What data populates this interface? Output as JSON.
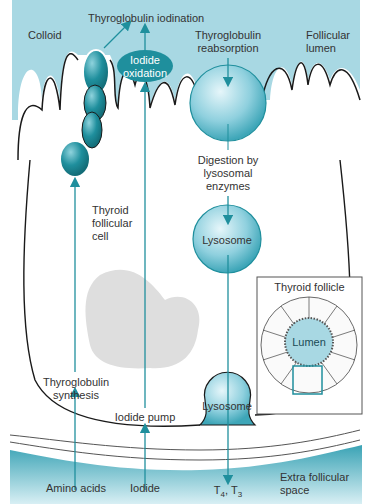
{
  "colors": {
    "colloid": "#a8d8e3",
    "teal": "#1f8f9d",
    "dark_teal": "#187c88",
    "nucleus": "#dedede",
    "outline": "#1a1a1a",
    "extracellular": "#5fb7c7"
  },
  "labels": {
    "colloid": "Colloid",
    "thyroglobulin_iodination": "Thyroglobulin iodination",
    "iodide_oxidation_1": "Iodide",
    "iodide_oxidation_2": "oxidation",
    "thyroglobulin_reabsorption_1": "Thyroglobulin",
    "thyroglobulin_reabsorption_2": "reabsorption",
    "follicular_lumen_1": "Follicular",
    "follicular_lumen_2": "lumen",
    "digestion_1": "Digestion by",
    "digestion_2": "lysosomal",
    "digestion_3": "enzymes",
    "thyroid_follicular_cell_1": "Thyroid",
    "thyroid_follicular_cell_2": "follicular",
    "thyroid_follicular_cell_3": "cell",
    "lysosome_upper": "Lysosome",
    "lysosome_lower": "Lysosome",
    "thyroglobulin_synthesis_1": "Thyroglobulin",
    "thyroglobulin_synthesis_2": "synthesis",
    "iodide_pump": "Iodide pump",
    "amino_acids": "Amino acids",
    "iodide": "Iodide",
    "t4": "T",
    "t4_sub": "4",
    "t3": ", T",
    "t3_sub": "3",
    "extra_follicular_1": "Extra follicular",
    "extra_follicular_2": "space"
  },
  "inset": {
    "title": "Thyroid follicle",
    "lumen_label": "Lumen"
  }
}
